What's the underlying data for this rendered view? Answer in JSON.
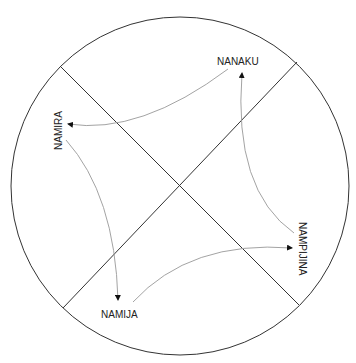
{
  "diagram": {
    "title": "",
    "labels": {
      "top": "NANAKU",
      "left": "NAMIRA",
      "bottom": "NAMIJA",
      "right": "NAMPIJINA"
    },
    "colors": {
      "circle": "#333333",
      "divider": "#333333",
      "arrow": "#999999",
      "arrowhead": "#111111",
      "text": "#222222"
    },
    "arrows": [
      {
        "from": "NANAKU",
        "to": "NAMIRA"
      },
      {
        "from": "NAMIRA",
        "to": "NAMIJA"
      },
      {
        "from": "NAMIJA",
        "to": "NAMPIJINA"
      },
      {
        "from": "NAMPIJINA",
        "to": "NANAKU"
      }
    ]
  }
}
